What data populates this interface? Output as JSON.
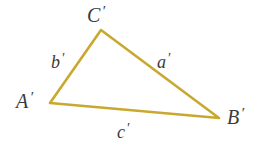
{
  "figure": {
    "kind": "geometry-diagram",
    "shape": "triangle",
    "background_color": "#ffffff",
    "stroke_color": "#c9a830",
    "stroke_width": 2.6,
    "label_color": "#3b3b3b",
    "width": 258,
    "height": 154
  },
  "vertices": [
    {
      "name": "vertex-a",
      "label": "A",
      "prime": "′",
      "x": 50,
      "y": 103
    },
    {
      "name": "vertex-b",
      "label": "B",
      "prime": "′",
      "x": 219,
      "y": 118
    },
    {
      "name": "vertex-c",
      "label": "C",
      "prime": "′",
      "x": 101,
      "y": 30
    }
  ],
  "sides": [
    {
      "name": "side-a",
      "label": "a",
      "prime": "′",
      "from": "vertex-b",
      "to": "vertex-c"
    },
    {
      "name": "side-b",
      "label": "b",
      "prime": "′",
      "from": "vertex-a",
      "to": "vertex-c"
    },
    {
      "name": "side-c",
      "label": "c",
      "prime": "′",
      "from": "vertex-a",
      "to": "vertex-b"
    }
  ],
  "polygon_points": "50,103 101,30 219,118"
}
